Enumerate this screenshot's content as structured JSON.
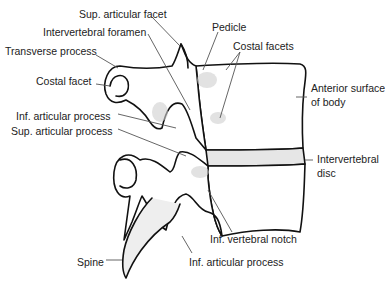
{
  "diagram": {
    "colors": {
      "outline": "#111111",
      "shade": "#d4d4d4",
      "leader": "#555555",
      "text": "#222222"
    },
    "labels": [
      {
        "id": "sup-articular-facet",
        "text": "Sup. articular facet",
        "x": 79,
        "y": 8
      },
      {
        "id": "pedicle",
        "text": "Pedicle",
        "x": 212,
        "y": 21
      },
      {
        "id": "intervertebral-foramen",
        "text": "Intervertebral foramen",
        "x": 43,
        "y": 26
      },
      {
        "id": "costal-facets",
        "text": "Costal facets",
        "x": 233,
        "y": 40
      },
      {
        "id": "transverse-process",
        "text": "Transverse process",
        "x": 5,
        "y": 45
      },
      {
        "id": "costal-facet",
        "text": "Costal facet",
        "x": 36,
        "y": 75
      },
      {
        "id": "anterior-surface-of-body-1",
        "text": "Anterior surface",
        "x": 311,
        "y": 82
      },
      {
        "id": "anterior-surface-of-body-2",
        "text": "of body",
        "x": 311,
        "y": 96
      },
      {
        "id": "inf-articular-process-upper",
        "text": "Inf. articular process",
        "x": 16,
        "y": 110
      },
      {
        "id": "sup-articular-process",
        "text": "Sup. articular process",
        "x": 11,
        "y": 125
      },
      {
        "id": "intervertebral-disc-1",
        "text": "Intervertebral",
        "x": 317,
        "y": 153
      },
      {
        "id": "intervertebral-disc-2",
        "text": "disc",
        "x": 317,
        "y": 167
      },
      {
        "id": "inf-vertebral-notch",
        "text": "Inf. vertebral notch",
        "x": 210,
        "y": 233
      },
      {
        "id": "inf-articular-process-lower",
        "text": "Inf. articular process",
        "x": 189,
        "y": 256
      },
      {
        "id": "spine",
        "text": "Spine",
        "x": 77,
        "y": 256
      }
    ]
  }
}
